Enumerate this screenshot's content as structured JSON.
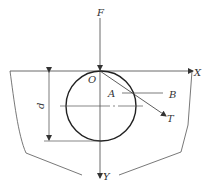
{
  "diagram": {
    "labels": {
      "force": "F",
      "origin": "O",
      "x_axis": "X",
      "y_axis": "Y",
      "point_a": "A",
      "point_b": "B",
      "tangent": "T",
      "diameter": "d"
    },
    "colors": {
      "stroke": "#333333",
      "circle": "#222222",
      "background": "#ffffff"
    }
  }
}
